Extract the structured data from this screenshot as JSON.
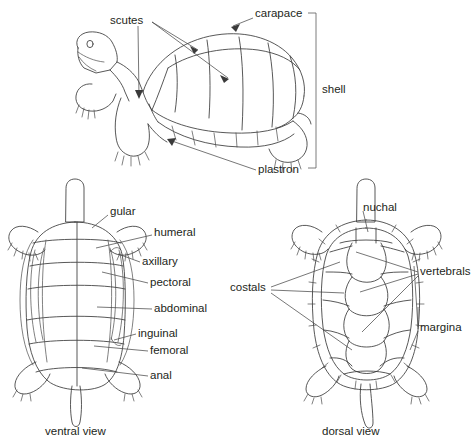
{
  "figure": {
    "background_color": "#ffffff",
    "line_color": "#3a3a3a",
    "text_color": "#231f20"
  },
  "lateral_view": {
    "labels": {
      "scutes": "scutes",
      "carapace": "carapace",
      "plastron": "plastron",
      "shell": "shell"
    }
  },
  "ventral_view": {
    "caption": "ventral view",
    "labels": {
      "gular": "gular",
      "humeral": "humeral",
      "axillary": "axillary",
      "pectoral": "pectoral",
      "abdominal": "abdominal",
      "inguinal": "inguinal",
      "femoral": "femoral",
      "anal": "anal"
    }
  },
  "dorsal_view": {
    "caption": "dorsal view",
    "labels": {
      "nuchal": "nuchal",
      "costals": "costals",
      "vertebrals": "vertebrals",
      "marginals": "margina"
    }
  }
}
